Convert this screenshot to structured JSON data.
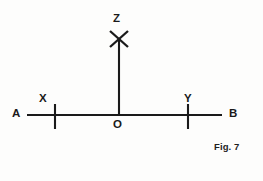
{
  "figure": {
    "caption": "Fig. 7",
    "ink_color": "#1a1a1a",
    "background_color": "#fdfdfc",
    "points": {
      "A": "A",
      "B": "B",
      "X": "X",
      "Y": "Y",
      "Z": "Z",
      "O": "O"
    },
    "geometry": {
      "baseline": {
        "name": "line-AB",
        "x1": 27,
        "y1": 115,
        "x2": 222,
        "y2": 115
      },
      "vertical": {
        "name": "line-OZ",
        "x1": 119,
        "y1": 40,
        "x2": 119,
        "y2": 115
      },
      "tick_X": {
        "x": 55,
        "y1": 104,
        "y2": 129
      },
      "tick_Y": {
        "x": 188,
        "y1": 104,
        "y2": 129
      },
      "cross_Z": {
        "cx": 119,
        "cy": 39,
        "arm": 10
      }
    }
  }
}
